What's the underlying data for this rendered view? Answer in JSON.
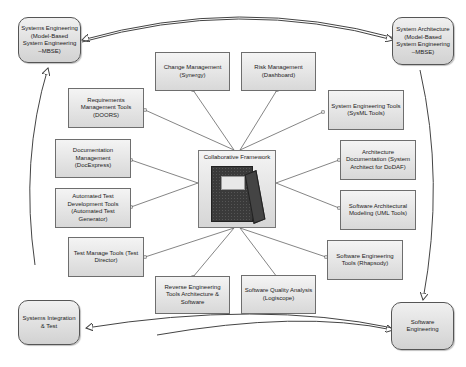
{
  "diagram": {
    "center": {
      "label": "Collaborative Framework",
      "icon": "notebook-icon"
    },
    "corners": {
      "top_left": "Systems Engineering (Model-Based System Engineering –MBSE)",
      "top_right": "System Architecture (Model-Based System Engineering –MBSE)",
      "bottom_left": "Systems Integration & Test",
      "bottom_right": "Software Engineering"
    },
    "tools": {
      "change_mgmt": "Change Management (Synergy)",
      "risk_mgmt": "Risk Management (Dashboard)",
      "requirements": "Requirements Management Tools (DOORS)",
      "sys_eng_tools": "System Engineering Tools (SysML Tools)",
      "documentation": "Documentation Management (DocExpress)",
      "arch_doc": "Architecture Documentation (System Architect for DoDAF)",
      "auto_test": "Automated Test Development Tools (Automated Test Generator)",
      "sw_arch_model": "Software Architectural Modeling (UML Tools)",
      "test_manage": "Test Manage Tools (Test Director)",
      "sw_eng_tools": "Software Engineering Tools (Rhapsody)",
      "reverse_eng": "Reverse Engineering Tools Architecture & Software",
      "sw_quality": "Software Quality Analysis (Logiscope)"
    }
  }
}
